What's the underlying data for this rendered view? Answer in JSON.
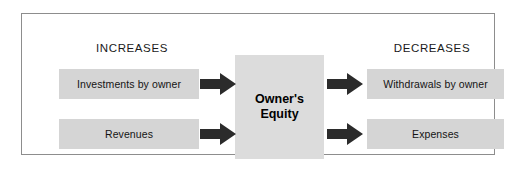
{
  "diagram": {
    "frame": {
      "border_color": "#8d8d8d",
      "background": "#ffffff"
    },
    "columns": {
      "left_heading": "INCREASES",
      "right_heading": "DECREASES"
    },
    "center": {
      "line1": "Owner's",
      "line2": "Equity",
      "fill": "#dcdcdc"
    },
    "increases": [
      {
        "label": "Investments by owner",
        "fill": "#d5d5d5"
      },
      {
        "label": "Revenues",
        "fill": "#d5d5d5"
      }
    ],
    "decreases": [
      {
        "label": "Withdrawals by owner",
        "fill": "#d5d5d5"
      },
      {
        "label": "Expenses",
        "fill": "#d5d5d5"
      }
    ],
    "arrows": [
      {
        "name": "investments-to-equity",
        "direction": "right",
        "color": "#2b2b2b"
      },
      {
        "name": "revenues-to-equity",
        "direction": "right",
        "color": "#2b2b2b"
      },
      {
        "name": "equity-to-withdrawals",
        "direction": "right",
        "color": "#2b2b2b"
      },
      {
        "name": "equity-to-expenses",
        "direction": "right",
        "color": "#2b2b2b"
      }
    ]
  }
}
